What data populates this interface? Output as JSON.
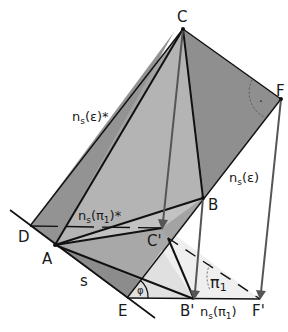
{
  "figure": {
    "colors": {
      "plane_dark": "#8c8c8c",
      "plane_mid": "#a6a6a6",
      "plane_light": "#bdbdbd",
      "triangle_light": "#e6e6e6",
      "line": "#111111",
      "projector": "#5a5a5a"
    },
    "points": [
      {
        "id": "C",
        "label": "C",
        "x": 183,
        "y": 29
      },
      {
        "id": "F",
        "label": "F",
        "x": 281,
        "y": 99
      },
      {
        "id": "B",
        "label": "B",
        "x": 203,
        "y": 198
      },
      {
        "id": "D",
        "label": "D",
        "x": 30,
        "y": 226
      },
      {
        "id": "A",
        "label": "A",
        "x": 55,
        "y": 245
      },
      {
        "id": "C'",
        "label": "C'",
        "x": 162,
        "y": 228
      },
      {
        "id": "E",
        "label": "E",
        "x": 127,
        "y": 298
      },
      {
        "id": "B'",
        "label": "B'",
        "x": 194,
        "y": 299
      },
      {
        "id": "F'",
        "label": "F'",
        "x": 260,
        "y": 299
      }
    ],
    "labels": {
      "C": "C",
      "F": "F",
      "B": "B",
      "D": "D",
      "A": "A",
      "Cp": "C'",
      "E": "E",
      "Bp": "B'",
      "Fp": "F'",
      "s": "s",
      "phi": "φ",
      "pi1": "π",
      "pi1_sub": "1",
      "ns_eps_star": "n",
      "ns_eps_star_sub": "s",
      "ns_eps_star_rest": "(ε)*",
      "ns_eps": "n",
      "ns_eps_sub": "s",
      "ns_eps_rest": "(ε)",
      "ns_pi1_star": "n",
      "ns_pi1_star_sub": "s",
      "ns_pi1_star_rest": "(π",
      "ns_pi1_star_sub2": "1",
      "ns_pi1_star_end": ")*",
      "ns_pi1": "n",
      "ns_pi1_sub": "s",
      "ns_pi1_rest": "(π",
      "ns_pi1_sub2": "1",
      "ns_pi1_end": ")",
      "right_angle_mark": "·"
    }
  }
}
